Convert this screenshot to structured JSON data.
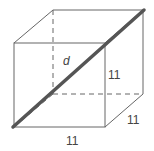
{
  "diagram": {
    "type": "cube",
    "labels": {
      "diagonal": "d",
      "height": "11",
      "depth": "11",
      "width": "11"
    },
    "colors": {
      "edge": "#666666",
      "diagonal": "#555555",
      "text": "#444444"
    }
  }
}
